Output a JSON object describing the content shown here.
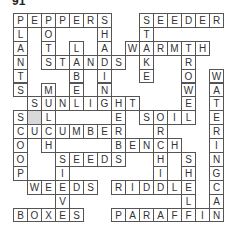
{
  "puzzle": {
    "title": "91",
    "rows": 15,
    "cols": 15,
    "grid": [
      "PEPPERS__SEEDER",
      "L_O___H__T_____",
      "A_T_L_A_WARMTH_",
      "N_STANDS_K__R__",
      "T___B_I__E__O_W",
      "S_M_E_N_____W_A",
      "_SUNLIGHT___E_T",
      "S#L_____E_SOIL_E",
      "CUCUMBER__R___R",
      "O_H____BENCH__I",
      "O__SEEDS__H_S_N",
      "P__I______I_H_G",
      "_WEEDS_RIDDLE_C",
      "___V________L_A",
      "BOXES__PARAFFIN"
    ],
    "shaded_cells": [
      [
        7,
        1
      ]
    ],
    "words": {
      "across": [
        "PEPPERS",
        "SEEDER",
        "WARMTH",
        "STANDS",
        "SUNLIGHT",
        "SOIL",
        "CUCUMBER",
        "BENCH",
        "SEEDS",
        "WEEDS",
        "RIDDLE",
        "BOXES",
        "PARAFFIN"
      ],
      "down": [
        "PLANTS",
        "POTS",
        "LABEL",
        "SHADING",
        "STAKE",
        "TROWEL",
        "WATERINGCAN",
        "MULCH",
        "HERB",
        "SCOOP",
        "ORCHID",
        "SIEVE",
        "SHELF"
      ]
    }
  }
}
